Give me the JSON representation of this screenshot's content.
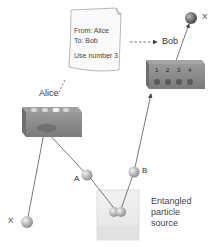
{
  "diagram": {
    "labels": {
      "alice": "Alice",
      "bob": "Bob",
      "particle_a": "A",
      "particle_b": "B",
      "particle_x_input": "X",
      "particle_x_output": "X"
    },
    "note": {
      "from": "From: Alice",
      "to": "To: Bob",
      "message": "Use number 3"
    },
    "source": {
      "line1": "Entangled",
      "line2": "particle",
      "line3": "source"
    },
    "bob_box": {
      "slots": [
        "1",
        "2",
        "3",
        "4"
      ]
    },
    "colors": {
      "line": "#555555",
      "box": "#8a8a8a",
      "ball": "#b8b8b8",
      "dark_ball": "#6a6a6a"
    }
  }
}
